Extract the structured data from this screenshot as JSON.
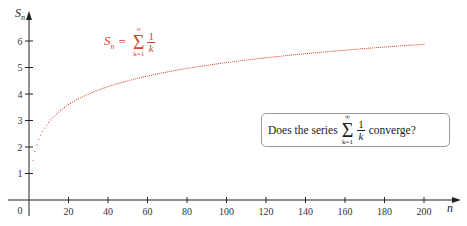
{
  "chart_data": {
    "type": "scatter",
    "title": "",
    "xlabel": "n",
    "ylabel": "S_n",
    "x_ticks": [
      20,
      40,
      60,
      80,
      100,
      120,
      140,
      160,
      180,
      200
    ],
    "y_ticks": [
      1,
      2,
      3,
      4,
      5,
      6
    ],
    "origin_label": "0",
    "xlim": [
      0,
      210
    ],
    "ylim": [
      0,
      7
    ],
    "grid": false,
    "series": [
      {
        "name": "S_n = sum_{k=1}^{n} 1/k",
        "color": "#d8472c",
        "marker": "dot",
        "n_range": [
          1,
          200
        ],
        "values_sample": [
          {
            "n": 1,
            "y": 1.0
          },
          {
            "n": 2,
            "y": 1.5
          },
          {
            "n": 3,
            "y": 1.833
          },
          {
            "n": 5,
            "y": 2.283
          },
          {
            "n": 10,
            "y": 2.929
          },
          {
            "n": 20,
            "y": 3.598
          },
          {
            "n": 40,
            "y": 4.279
          },
          {
            "n": 60,
            "y": 4.68
          },
          {
            "n": 80,
            "y": 4.965
          },
          {
            "n": 100,
            "y": 5.187
          },
          {
            "n": 120,
            "y": 5.37
          },
          {
            "n": 140,
            "y": 5.524
          },
          {
            "n": 160,
            "y": 5.657
          },
          {
            "n": 180,
            "y": 5.775
          },
          {
            "n": 200,
            "y": 5.878
          }
        ]
      }
    ],
    "annotations": [
      {
        "text": "S_n = Σ_{k=1}^{n} 1/k",
        "color": "#d8472c",
        "position": "top-left"
      },
      {
        "text": "Does the series Σ_{k=1}^{∞} 1/k converge?",
        "boxed": true,
        "position": "middle-right"
      }
    ]
  },
  "formula": {
    "lhs": "S",
    "lhs_sub": "n",
    "eq": "=",
    "sigma": "Σ",
    "upper": "n",
    "lower": "k=1",
    "num": "1",
    "den": "k"
  },
  "question": {
    "prefix": "Does the series",
    "sigma": "Σ",
    "upper": "∞",
    "lower": "k=1",
    "num": "1",
    "den": "k",
    "suffix": "converge?"
  },
  "colors": {
    "series": "#d8472c",
    "axis": "#222222"
  }
}
